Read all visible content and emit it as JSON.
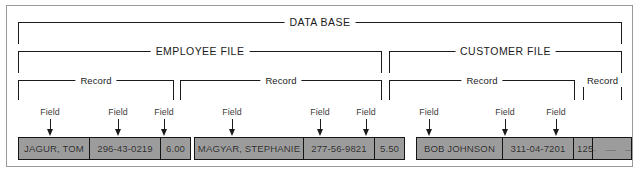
{
  "diagram": {
    "title": "DATA BASE",
    "levels": {
      "database_label": "DATA BASE",
      "file_label_employee": "EMPLOYEE FILE",
      "file_label_customer": "CUSTOMER FILE",
      "record_label": "Record",
      "field_label": "Field"
    },
    "brackets": {
      "database": {
        "label": "DATA BASE"
      },
      "files": [
        {
          "label": "EMPLOYEE FILE"
        },
        {
          "label": "CUSTOMER FILE"
        }
      ],
      "records": [
        {
          "label": "Record"
        },
        {
          "label": "Record"
        },
        {
          "label": "Record"
        },
        {
          "label": "Record"
        }
      ]
    },
    "field_callouts": [
      {
        "label": "Field"
      },
      {
        "label": "Field"
      },
      {
        "label": "Field"
      },
      {
        "label": "Field"
      },
      {
        "label": "Field"
      },
      {
        "label": "Field"
      },
      {
        "label": "Field"
      },
      {
        "label": "Field"
      },
      {
        "label": "Field"
      }
    ],
    "records": [
      {
        "file": "EMPLOYEE FILE",
        "fields": [
          {
            "value": "JAGUR, TOM"
          },
          {
            "value": "296-43-0219"
          },
          {
            "value": "6.00"
          }
        ]
      },
      {
        "file": "EMPLOYEE FILE",
        "fields": [
          {
            "value": "MAGYAR, STEPHANIE"
          },
          {
            "value": "277-56-9821"
          },
          {
            "value": "5.50"
          }
        ]
      },
      {
        "file": "CUSTOMER FILE",
        "fields": [
          {
            "value": "BOB JOHNSON"
          },
          {
            "value": "311-04-7201"
          },
          {
            "value": "125.00"
          }
        ]
      },
      {
        "file": "CUSTOMER FILE",
        "fields": [
          {
            "value": "— — —"
          }
        ]
      }
    ],
    "colors": {
      "cell_fill": "#9c9c9c",
      "cell_border": "#141414",
      "line": "#1b1b1b",
      "frame": "#9a9a9a",
      "background": "#ffffff",
      "callout_text": "#3b3b3b"
    }
  }
}
